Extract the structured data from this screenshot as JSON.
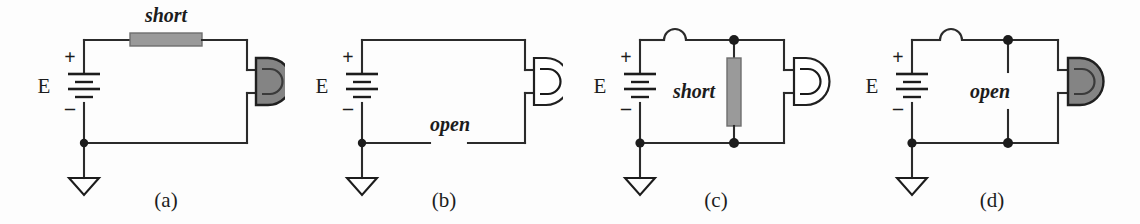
{
  "figure": {
    "background_color": "#fdfdfd",
    "wire_color": "#2b2b2b",
    "fault_fill_color": "#9a9a9a",
    "lamp_on_fill": "#848484",
    "lamp_off_fill": "#ffffff"
  },
  "circuits": [
    {
      "id": "a",
      "caption": "(a)",
      "source_label": "E",
      "plus_sign": "+",
      "minus_sign": "–",
      "fault_label": "short",
      "fault_type": "shorted-series-resistor",
      "fault_position": "top-wire",
      "lamp_state": "on",
      "ground_symbol": "earth-ground",
      "has_bump": false,
      "node_dots": 1
    },
    {
      "id": "b",
      "caption": "(b)",
      "source_label": "E",
      "plus_sign": "+",
      "minus_sign": "–",
      "fault_label": "open",
      "fault_type": "open-series-wire",
      "fault_position": "bottom-wire",
      "lamp_state": "off",
      "ground_symbol": "earth-ground",
      "has_bump": false,
      "node_dots": 1
    },
    {
      "id": "c",
      "caption": "(c)",
      "source_label": "E",
      "plus_sign": "+",
      "minus_sign": "–",
      "fault_label": "short",
      "fault_type": "shorted-parallel-resistor",
      "fault_position": "parallel-branch",
      "lamp_state": "off",
      "ground_symbol": "earth-ground",
      "has_bump": true,
      "node_dots": 3
    },
    {
      "id": "d",
      "caption": "(d)",
      "source_label": "E",
      "plus_sign": "+",
      "minus_sign": "–",
      "fault_label": "open",
      "fault_type": "open-parallel-branch",
      "fault_position": "parallel-branch",
      "lamp_state": "on",
      "ground_symbol": "earth-ground",
      "has_bump": true,
      "node_dots": 3
    }
  ]
}
